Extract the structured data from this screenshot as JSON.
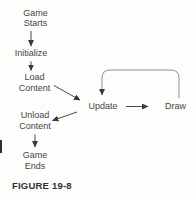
{
  "figure": {
    "caption": "FIGURE 19-8",
    "colors": {
      "background": "#fdfdfc",
      "text": "#454545",
      "arrow": "#4a4a4a",
      "loop_arrow": "#8f8f8f",
      "arrowhead": "#3a3a3a",
      "caption_text": "#2f2f2f"
    },
    "flowchart": {
      "nodes": [
        {
          "id": "game-starts",
          "lines": [
            "Game",
            "Starts"
          ]
        },
        {
          "id": "initialize",
          "lines": [
            "Initialize"
          ]
        },
        {
          "id": "load-content",
          "lines": [
            "Load",
            "Content"
          ]
        },
        {
          "id": "update",
          "lines": [
            "Update"
          ]
        },
        {
          "id": "draw",
          "lines": [
            "Draw"
          ]
        },
        {
          "id": "unload-content",
          "lines": [
            "Unload",
            "Content"
          ]
        },
        {
          "id": "game-ends",
          "lines": [
            "Game",
            "Ends"
          ]
        }
      ],
      "edges": [
        {
          "from": "game-starts",
          "to": "initialize"
        },
        {
          "from": "initialize",
          "to": "load-content"
        },
        {
          "from": "load-content",
          "to": "update"
        },
        {
          "from": "update",
          "to": "draw"
        },
        {
          "from": "draw",
          "to": "update",
          "style": "loop"
        },
        {
          "from": "update",
          "to": "unload-content"
        },
        {
          "from": "unload-content",
          "to": "game-ends"
        }
      ]
    }
  }
}
